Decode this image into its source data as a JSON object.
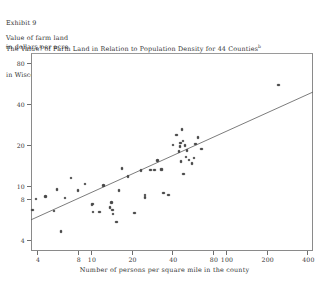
{
  "exhibit": {
    "number_line": "Exhibit 9",
    "title_line_1_a": "The Value",
    "title_sup_a": "a",
    "title_line_1_b": " of Farm Land in Relation to Population Density for 44 Counties",
    "title_sup_b": "b",
    "title_line_2": "in Wisconsin in 1860"
  },
  "axis_label_block": {
    "line1": "Value of farm land",
    "line2": "in dollars per acre"
  },
  "chart_data": {
    "type": "scatter",
    "xlabel": "Number of persons per square mile in the county",
    "ylabel": "Value of farm land in dollars per acre",
    "xscale": "log",
    "yscale": "log",
    "xlim": [
      3.6,
      440
    ],
    "ylim": [
      3.3,
      95
    ],
    "grid": false,
    "legend": null,
    "xticks": [
      4,
      8,
      10,
      20,
      40,
      80,
      100,
      200,
      400
    ],
    "xticklabels": [
      "4",
      "8",
      "10",
      "20",
      "40",
      "80",
      "100",
      "200",
      "400"
    ],
    "yticks": [
      4,
      8,
      10,
      20,
      40,
      80
    ],
    "yticklabels": [
      "4",
      "8",
      "10",
      "20",
      "40",
      "80"
    ],
    "marker": "open-circle",
    "points": [
      {
        "x": 3.7,
        "y": 6.6
      },
      {
        "x": 3.9,
        "y": 8.0
      },
      {
        "x": 4.6,
        "y": 8.3
      },
      {
        "x": 5.3,
        "y": 6.5
      },
      {
        "x": 5.6,
        "y": 9.4
      },
      {
        "x": 6.0,
        "y": 4.6
      },
      {
        "x": 6.4,
        "y": 8.1
      },
      {
        "x": 7.1,
        "y": 11.4
      },
      {
        "x": 8.0,
        "y": 9.2
      },
      {
        "x": 9.0,
        "y": 10.3
      },
      {
        "x": 10.2,
        "y": 7.2
      },
      {
        "x": 10.3,
        "y": 7.3
      },
      {
        "x": 10.4,
        "y": 6.4
      },
      {
        "x": 11.6,
        "y": 6.4
      },
      {
        "x": 12.4,
        "y": 10.0
      },
      {
        "x": 13.8,
        "y": 6.9
      },
      {
        "x": 14.2,
        "y": 7.5
      },
      {
        "x": 14.4,
        "y": 6.6
      },
      {
        "x": 14.6,
        "y": 6.2
      },
      {
        "x": 15.5,
        "y": 5.4
      },
      {
        "x": 16.1,
        "y": 9.2
      },
      {
        "x": 17.0,
        "y": 13.4
      },
      {
        "x": 18.8,
        "y": 11.7
      },
      {
        "x": 21.0,
        "y": 6.3
      },
      {
        "x": 23.5,
        "y": 12.9
      },
      {
        "x": 25.0,
        "y": 8.2
      },
      {
        "x": 25.2,
        "y": 8.5
      },
      {
        "x": 27.5,
        "y": 13.1
      },
      {
        "x": 29.5,
        "y": 13.1
      },
      {
        "x": 31.0,
        "y": 15.3
      },
      {
        "x": 33.0,
        "y": 13.2
      },
      {
        "x": 33.6,
        "y": 13.2
      },
      {
        "x": 34.5,
        "y": 8.8
      },
      {
        "x": 37.5,
        "y": 8.5
      },
      {
        "x": 40.5,
        "y": 20.0
      },
      {
        "x": 43.0,
        "y": 23.6
      },
      {
        "x": 45.0,
        "y": 17.9
      },
      {
        "x": 45.5,
        "y": 19.5
      },
      {
        "x": 46.0,
        "y": 20.6
      },
      {
        "x": 46.5,
        "y": 15.1
      },
      {
        "x": 47.0,
        "y": 26.0
      },
      {
        "x": 48.0,
        "y": 21.4
      },
      {
        "x": 48.5,
        "y": 12.2
      },
      {
        "x": 49.5,
        "y": 19.8
      },
      {
        "x": 50.5,
        "y": 16.2
      },
      {
        "x": 51.5,
        "y": 18.2
      },
      {
        "x": 53.0,
        "y": 15.4
      },
      {
        "x": 56.0,
        "y": 14.6
      },
      {
        "x": 58.0,
        "y": 16.0
      },
      {
        "x": 59.5,
        "y": 20.2
      },
      {
        "x": 62.0,
        "y": 22.6
      },
      {
        "x": 66.0,
        "y": 18.6
      },
      {
        "x": 245.0,
        "y": 55.0
      }
    ],
    "fit_line": {
      "label": "regression line",
      "x_start": 3.6,
      "y_start": 5.6,
      "x_end": 440,
      "y_end": 49.0
    }
  }
}
